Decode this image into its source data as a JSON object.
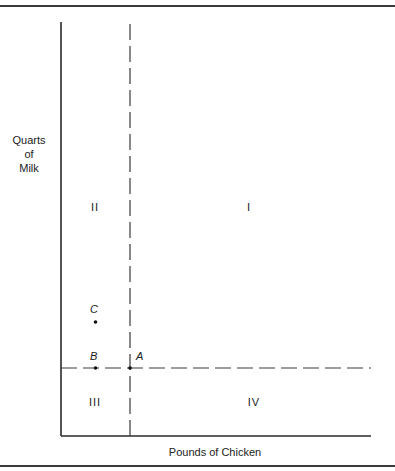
{
  "axes": {
    "y_label_lines": [
      "Quarts",
      "of",
      "Milk"
    ],
    "x_label": "Pounds of Chicken"
  },
  "quadrants": {
    "I": "I",
    "II": "II",
    "III": "III",
    "IV": "IV"
  },
  "points": [
    {
      "id": "A",
      "label": "A",
      "x": 1.0,
      "y": 1.0
    },
    {
      "id": "B",
      "label": "B",
      "x": 0.5,
      "y": 1.0
    },
    {
      "id": "C",
      "label": "C",
      "x": 0.5,
      "y": 2.4
    }
  ],
  "reference_point": "A",
  "colors": {
    "line": "#2a2a2a",
    "dash": "#3a3a3a",
    "point": "#111111"
  }
}
